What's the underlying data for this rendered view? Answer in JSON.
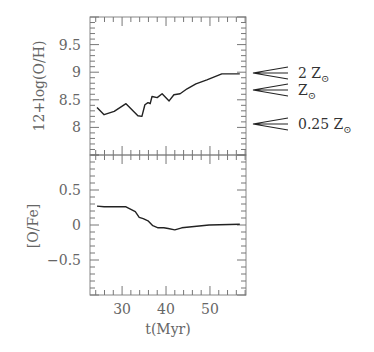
{
  "chart_data": [
    {
      "type": "line",
      "panel": "top",
      "title": "",
      "xlabel": "t(Myr)",
      "ylabel": "12+log(O/H)",
      "xlim": [
        22.7,
        58.2
      ],
      "ylim": [
        7.5,
        10.0
      ],
      "yticks": [
        8,
        8.5,
        9,
        9.5
      ],
      "ytick_labels": [
        "8",
        "8.5",
        "9",
        "9.5"
      ],
      "grid": false,
      "series": [
        {
          "name": "12+log(O/H)",
          "x": [
            24.3,
            25.9,
            28.2,
            30.9,
            33.6,
            34.5,
            35.2,
            35.9,
            36.4,
            36.8,
            38.0,
            39.1,
            40.7,
            41.8,
            43.2,
            44.8,
            46.8,
            49.3,
            52.7,
            56.8
          ],
          "y": [
            8.36,
            8.23,
            8.29,
            8.43,
            8.21,
            8.2,
            8.41,
            8.45,
            8.43,
            8.56,
            8.54,
            8.61,
            8.48,
            8.59,
            8.61,
            8.7,
            8.79,
            8.86,
            8.97,
            8.97
          ]
        }
      ],
      "annotations": [
        {
          "text": "2 Z⊙",
          "y": 9.0,
          "type": "arrow"
        },
        {
          "text": "Z⊙",
          "y": 8.69,
          "type": "arrow"
        },
        {
          "text": "0.25 Z⊙",
          "y": 8.09,
          "type": "arrow"
        }
      ]
    },
    {
      "type": "line",
      "panel": "bottom",
      "title": "",
      "xlabel": "t(Myr)",
      "ylabel": "[O/Fe]",
      "xlim": [
        22.7,
        58.2
      ],
      "ylim": [
        -1.0,
        1.0
      ],
      "xticks": [
        30,
        40,
        50
      ],
      "xtick_labels": [
        "30",
        "40",
        "50"
      ],
      "yticks": [
        -0.5,
        0,
        0.5
      ],
      "ytick_labels": [
        "−0.5",
        "0",
        "0.5"
      ],
      "grid": false,
      "series": [
        {
          "name": "[O/Fe]",
          "x": [
            24.3,
            25.9,
            30.9,
            33.0,
            33.9,
            34.8,
            35.9,
            37.0,
            38.2,
            39.5,
            40.5,
            42.0,
            43.6,
            49.8,
            56.8
          ],
          "y": [
            0.27,
            0.26,
            0.26,
            0.19,
            0.11,
            0.09,
            0.06,
            -0.01,
            -0.04,
            -0.04,
            -0.05,
            -0.07,
            -0.04,
            0.0,
            0.01
          ]
        }
      ]
    }
  ],
  "labels": {
    "top_ylabel": "12+log(O/H)",
    "bottom_ylabel": "[O/Fe]",
    "xlabel": "t(Myr)",
    "ann_2z": "2 Z",
    "ann_z": "Z",
    "ann_025z": "0.25 Z",
    "sun": "⊙"
  }
}
